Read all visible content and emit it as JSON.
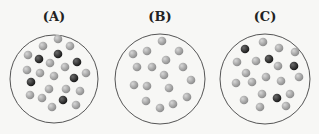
{
  "panels": [
    {
      "label": "(A)",
      "cx": 54,
      "cy": 79,
      "r": 44,
      "balls": [
        [
          58,
          39,
          "l"
        ],
        [
          43,
          46,
          "l"
        ],
        [
          70,
          46,
          "l"
        ],
        [
          28,
          55,
          "l"
        ],
        [
          39,
          59,
          "d"
        ],
        [
          58,
          54,
          "d"
        ],
        [
          77,
          62,
          "d"
        ],
        [
          50,
          63,
          "l"
        ],
        [
          65,
          67,
          "l"
        ],
        [
          27,
          70,
          "l"
        ],
        [
          40,
          73,
          "l"
        ],
        [
          54,
          76,
          "l"
        ],
        [
          74,
          78,
          "d"
        ],
        [
          86,
          73,
          "l"
        ],
        [
          31,
          82,
          "d"
        ],
        [
          49,
          89,
          "l"
        ],
        [
          66,
          89,
          "l"
        ],
        [
          80,
          91,
          "l"
        ],
        [
          30,
          95,
          "l"
        ],
        [
          42,
          98,
          "l"
        ],
        [
          63,
          100,
          "d"
        ],
        [
          52,
          107,
          "l"
        ],
        [
          76,
          105,
          "l"
        ]
      ]
    },
    {
      "label": "(B)",
      "cx": 160,
      "cy": 79,
      "r": 45,
      "balls": [
        [
          162,
          41,
          "l"
        ],
        [
          133,
          54,
          "l"
        ],
        [
          147,
          51,
          "l"
        ],
        [
          179,
          51,
          "l"
        ],
        [
          166,
          60,
          "l"
        ],
        [
          137,
          67,
          "l"
        ],
        [
          152,
          67,
          "l"
        ],
        [
          183,
          67,
          "l"
        ],
        [
          164,
          75,
          "l"
        ],
        [
          191,
          80,
          "l"
        ],
        [
          134,
          85,
          "l"
        ],
        [
          147,
          86,
          "l"
        ],
        [
          169,
          88,
          "l"
        ],
        [
          146,
          101,
          "l"
        ],
        [
          187,
          97,
          "l"
        ],
        [
          173,
          104,
          "l"
        ],
        [
          160,
          108,
          "l"
        ]
      ]
    },
    {
      "label": "(C)",
      "cx": 265,
      "cy": 79,
      "r": 45,
      "balls": [
        [
          245,
          49,
          "d"
        ],
        [
          263,
          42,
          "l"
        ],
        [
          279,
          48,
          "l"
        ],
        [
          295,
          52,
          "l"
        ],
        [
          237,
          62,
          "l"
        ],
        [
          256,
          61,
          "l"
        ],
        [
          269,
          59,
          "d"
        ],
        [
          278,
          66,
          "l"
        ],
        [
          294,
          66,
          "d"
        ],
        [
          246,
          73,
          "l"
        ],
        [
          266,
          77,
          "l"
        ],
        [
          299,
          77,
          "l"
        ],
        [
          236,
          83,
          "l"
        ],
        [
          252,
          82,
          "l"
        ],
        [
          281,
          81,
          "l"
        ],
        [
          262,
          94,
          "l"
        ],
        [
          277,
          98,
          "d"
        ],
        [
          290,
          94,
          "l"
        ],
        [
          244,
          100,
          "l"
        ],
        [
          260,
          107,
          "l"
        ],
        [
          286,
          106,
          "l"
        ]
      ]
    }
  ],
  "colors": {
    "light": "#a9a9a9",
    "dark": "#2e2e2e",
    "outline": "#555555"
  }
}
